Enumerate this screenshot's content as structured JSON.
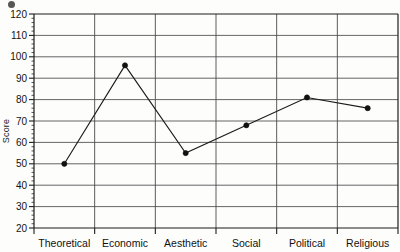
{
  "chart_data": {
    "type": "line",
    "title": "",
    "xlabel": "",
    "ylabel": "Score",
    "categories": [
      "Theoretical",
      "Economic",
      "Aesthetic",
      "Social",
      "Political",
      "Religious"
    ],
    "values": [
      50,
      96,
      55,
      68,
      81,
      76
    ],
    "series": [
      {
        "name": "Score",
        "values": [
          50,
          96,
          55,
          68,
          81,
          76
        ]
      }
    ],
    "ylim": [
      20,
      120
    ],
    "ytick_step": 10,
    "yticks": [
      20,
      30,
      40,
      50,
      60,
      70,
      80,
      90,
      100,
      110,
      120
    ],
    "ytick_labels": [
      "20",
      "30",
      "40",
      "50",
      "60",
      "70",
      "80",
      "90",
      "100",
      "110",
      "120"
    ],
    "grid": true,
    "grid_horizontal": true,
    "grid_vertical": true,
    "legend": false,
    "legend_position": "none",
    "marker": "filled-circle",
    "line_color": "#1a1a1a",
    "marker_color": "#111111",
    "grid_color": "#555555",
    "background_color": "#fdfdfc",
    "annotations": []
  },
  "axis": {
    "y_label_text": "Score"
  },
  "artifacts": {
    "scan_mark": "scan-smudge"
  }
}
